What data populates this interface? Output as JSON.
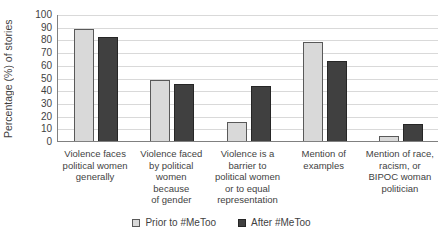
{
  "chart_data": {
    "type": "bar",
    "title": "",
    "xlabel": "",
    "ylabel": "Percentage (%) of stories",
    "ylim": [
      0,
      100
    ],
    "ytick_step": 10,
    "grid": true,
    "legend_position": "bottom",
    "categories": [
      "Violence faces\npolitical women\ngenerally",
      "Violence faced\nby political\nwomen\nbecause\nof gender",
      "Violence is a\nbarrier to\npolitical women\nor to equal\nrepresentation",
      "Mention of\nexamples",
      "Mention of race,\nracism, or\nBIPOC woman\npolitician"
    ],
    "series": [
      {
        "name": "Prior to #MeToo",
        "fill": "#d9d9d9",
        "border": "#595959",
        "values": [
          88,
          48,
          15,
          78,
          4
        ]
      },
      {
        "name": "After #MeToo",
        "fill": "#404040",
        "border": "#262626",
        "values": [
          82,
          45,
          43,
          63,
          13
        ]
      }
    ],
    "colors": {
      "gridline": "#d9d9d9",
      "axis": "#808080",
      "text": "#3f3f3f",
      "background": "#ffffff"
    }
  }
}
